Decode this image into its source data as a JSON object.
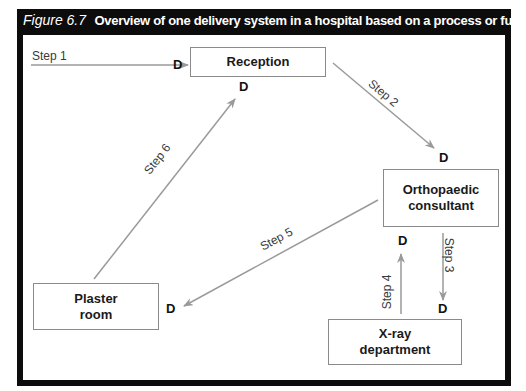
{
  "figure": {
    "number": "Figure 6.7",
    "title": "Overview of one delivery system in a hospital based on a process or functional layout"
  },
  "nodes": {
    "reception": "Reception",
    "orthopaedic_line1": "Orthopaedic",
    "orthopaedic_line2": "consultant",
    "plaster_line1": "Plaster",
    "plaster_line2": "room",
    "xray_line1": "X-ray",
    "xray_line2": "department"
  },
  "decision_marker": "D",
  "steps": {
    "step1": "Step 1",
    "step2": "Step 2",
    "step3": "Step 3",
    "step4": "Step 4",
    "step5": "Step 5",
    "step6": "Step 6"
  },
  "colors": {
    "title_bg": "#0c0c0c",
    "frame": "#0c0c0c",
    "arrow": "#9a9a9a",
    "box_border": "#8a8a8a"
  }
}
